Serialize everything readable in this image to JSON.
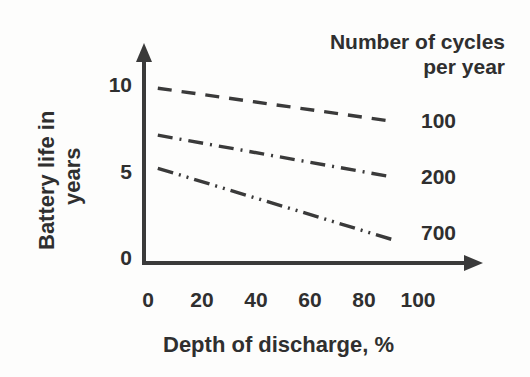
{
  "chart_data": {
    "type": "line",
    "title": "",
    "xlabel": "Depth of discharge, %",
    "ylabel": "Battery life in years",
    "ylabel_line1": "Battery life in",
    "ylabel_line2": "years",
    "xlim": [
      0,
      100
    ],
    "ylim": [
      0,
      11.5
    ],
    "xticks": [
      "0",
      "20",
      "40",
      "60",
      "80",
      "100"
    ],
    "xtick_values": [
      0,
      20,
      40,
      60,
      80,
      100
    ],
    "yticks": [
      "10",
      "5",
      "0"
    ],
    "ytick_values": [
      10,
      5,
      0
    ],
    "grid": false,
    "legend_position": "right",
    "legend_title": "Number of cycles per year",
    "legend_title_line1": "Number of cycles",
    "legend_title_line2": "per year",
    "axis_style": "arrowed-open-axes",
    "line_color": "#3a3a3a",
    "series": [
      {
        "name": "100",
        "label": "100",
        "dash_style": "dashed",
        "x": [
          5,
          90
        ],
        "values": [
          9.7,
          7.8
        ]
      },
      {
        "name": "200",
        "label": "200",
        "dash_style": "dash-dot",
        "x": [
          5,
          90
        ],
        "values": [
          7.0,
          4.6
        ]
      },
      {
        "name": "700",
        "label": "700",
        "dash_style": "dash-dot-dot",
        "x": [
          5,
          90
        ],
        "values": [
          5.1,
          1.0
        ]
      }
    ]
  },
  "axes": {
    "y_tick_0": "0",
    "y_tick_5": "5",
    "y_tick_10": "10",
    "x_tick_0": "0",
    "x_tick_20": "20",
    "x_tick_40": "40",
    "x_tick_60": "60",
    "x_tick_80": "80",
    "x_tick_100": "100"
  },
  "legend": {
    "title_line1": "Number of cycles",
    "title_line2": "per year",
    "item_100": "100",
    "item_200": "200",
    "item_700": "700"
  },
  "labels": {
    "x_axis_title": "Depth of discharge, %",
    "y_axis_title_line1": "Battery life in",
    "y_axis_title_line2": "years"
  },
  "colors": {
    "stroke": "#3a3a3a",
    "text": "#2f2f2f",
    "background": "#fdfdfc"
  }
}
